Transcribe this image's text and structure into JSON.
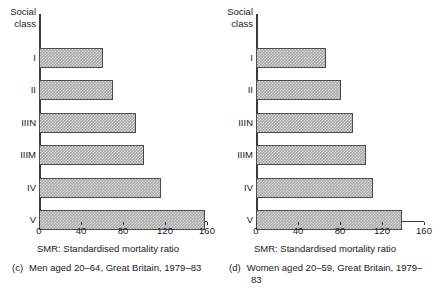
{
  "figure": {
    "axis_header": "Social\nclass",
    "bar_fill_color": "#a8a8a8",
    "bar_border_color": "#4a4a4a",
    "axis_color": "#3a3a3a"
  },
  "panels": [
    {
      "id": "panel-c",
      "axis_header_line1": "Social",
      "axis_header_line2": "class",
      "xlabel": "SMR: Standardised mortality ratio",
      "caption_tag": "(c)",
      "caption_text": "Men aged 20–64, Great Britain, 1979–83",
      "ticks": [
        "0",
        "40",
        "80",
        "120",
        "160"
      ],
      "categories": [
        "I",
        "II",
        "IIIN",
        "IIIM",
        "IV",
        "V"
      ],
      "values": [
        61,
        70,
        92,
        100,
        116,
        158
      ]
    },
    {
      "id": "panel-d",
      "axis_header_line1": "Social",
      "axis_header_line2": "class",
      "xlabel": "SMR: Standardised mortality ratio",
      "caption_tag": "(d)",
      "caption_text": "Women aged 20–59, Great Britain, 1979–83",
      "ticks": [
        "0",
        "40",
        "80",
        "120",
        "160"
      ],
      "categories": [
        "I",
        "II",
        "IIIN",
        "IIIM",
        "IV",
        "V"
      ],
      "values": [
        67,
        81,
        92,
        105,
        111,
        139
      ]
    }
  ],
  "chart_data": [
    {
      "type": "bar",
      "orientation": "horizontal",
      "title": "(c) Men aged 20–64, Great Britain, 1979–83",
      "categories": [
        "I",
        "II",
        "IIIN",
        "IIIM",
        "IV",
        "V"
      ],
      "values": [
        61,
        70,
        92,
        100,
        116,
        158
      ],
      "xlabel": "SMR: Standardised mortality ratio",
      "ylabel": "Social class",
      "xlim": [
        0,
        160
      ],
      "xticks": [
        0,
        40,
        80,
        120,
        160
      ],
      "grid": false,
      "legend": false
    },
    {
      "type": "bar",
      "orientation": "horizontal",
      "title": "(d) Women aged 20–59, Great Britain, 1979–83",
      "categories": [
        "I",
        "II",
        "IIIN",
        "IIIM",
        "IV",
        "V"
      ],
      "values": [
        67,
        81,
        92,
        105,
        111,
        139
      ],
      "xlabel": "SMR: Standardised mortality ratio",
      "ylabel": "Social class",
      "xlim": [
        0,
        160
      ],
      "xticks": [
        0,
        40,
        80,
        120,
        160
      ],
      "grid": false,
      "legend": false
    }
  ]
}
